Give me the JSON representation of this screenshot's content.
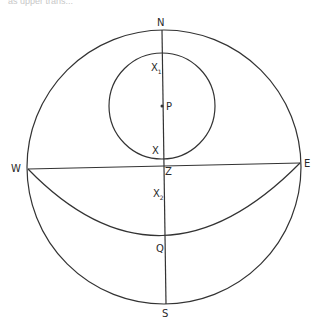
{
  "caption": "as upper trans...",
  "diagram": {
    "type": "celestial-sphere-projection",
    "outer_circle": {
      "cx": 164,
      "cy": 167,
      "r": 137
    },
    "inner_circle": {
      "cx": 162,
      "cy": 106,
      "r": 53
    },
    "meridian_line": {
      "from": "N",
      "to": "S"
    },
    "horizon_line": {
      "from": "W",
      "to": "E"
    },
    "arc": {
      "from": "W",
      "through": "Q",
      "to": "E"
    },
    "line_color": "#333333"
  },
  "labels": {
    "N": "N",
    "S": "S",
    "E": "E",
    "W": "W",
    "Z": "Z",
    "P": "P",
    "X": "X",
    "Q": "Q",
    "X1_main": "X",
    "X1_sub": "1",
    "X2_main": "X",
    "X2_sub": "2"
  }
}
